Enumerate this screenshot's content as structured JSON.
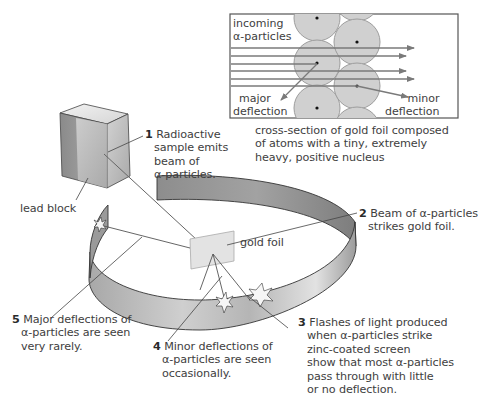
{
  "inset": {
    "incoming_label_line1": "incoming",
    "incoming_label_line2": "α-particles",
    "major_label_line1": "major",
    "major_label_line2": "deflection",
    "minor_label_line1": "minor",
    "minor_label_line2": "deflection",
    "caption_line1": "cross-section of gold foil composed",
    "caption_line2": "of atoms with a tiny, extremely",
    "caption_line3": "heavy, positive nucleus"
  },
  "labels": {
    "lead_block": "lead block",
    "gold_foil": "gold foil",
    "step1": {
      "num": "1",
      "line1": "Radioactive",
      "line2": "sample emits",
      "line3": "beam of",
      "line4": "α-particles."
    },
    "step2": {
      "num": "2",
      "line1": "Beam of α-particles",
      "line2": "strikes gold foil."
    },
    "step3": {
      "num": "3",
      "line1": "Flashes of light produced",
      "line2": "when α-particles strike",
      "line3": "zinc-coated screen",
      "line4": "show that most α-particles",
      "line5": "pass through with little",
      "line6": "or no deflection."
    },
    "step4": {
      "num": "4",
      "line1": "Minor deflections of",
      "line2": "α-particles are seen",
      "line3": "occasionally."
    },
    "step5": {
      "num": "5",
      "line1": "Major deflections of",
      "line2": "α-particles are seen",
      "line3": "very rarely."
    }
  },
  "colors": {
    "atom_fill": "#cfcfcf",
    "atom_stroke": "#9a9a9a",
    "arrow": "#777777",
    "screen_dark": "#8a8a8a",
    "screen_light": "#d8d8d8",
    "foil": "#e6e6e6",
    "block_top": "#e9e9e9",
    "block_front": "#bdbdbd",
    "block_side": "#9a9a9a"
  }
}
